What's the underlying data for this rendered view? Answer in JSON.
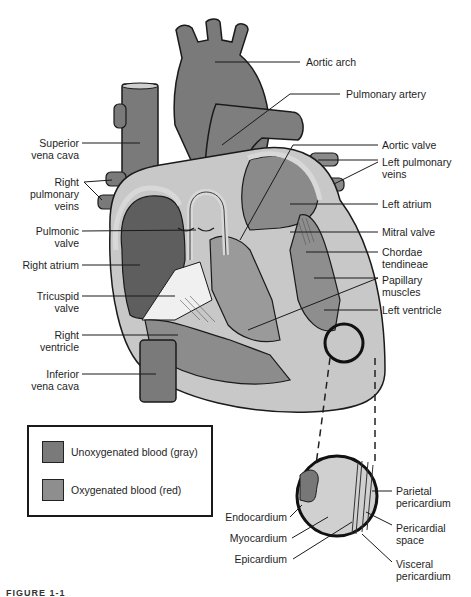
{
  "diagram": {
    "colors": {
      "unoxygenated": "#7a7a7a",
      "oxygenated": "#8c8c8c",
      "muscle_light": "#c8c8c8",
      "valve_white": "#f0f0f0",
      "outline": "#1a1a1a"
    },
    "labels_left": [
      {
        "id": "superior-vena-cava",
        "line1": "Superior",
        "line2": "vena cava"
      },
      {
        "id": "right-pulmonary-veins",
        "line1": "Right",
        "line2": "pulmonary",
        "line3": "veins"
      },
      {
        "id": "pulmonic-valve",
        "line1": "Pulmonic",
        "line2": "valve"
      },
      {
        "id": "right-atrium",
        "line1": "Right atrium"
      },
      {
        "id": "tricuspid-valve",
        "line1": "Tricuspid",
        "line2": "valve"
      },
      {
        "id": "right-ventricle",
        "line1": "Right",
        "line2": "ventricle"
      },
      {
        "id": "inferior-vena-cava",
        "line1": "Inferior",
        "line2": "vena cava"
      }
    ],
    "labels_right": [
      {
        "id": "aortic-arch",
        "line1": "Aortic arch"
      },
      {
        "id": "pulmonary-artery",
        "line1": "Pulmonary artery"
      },
      {
        "id": "aortic-valve",
        "line1": "Aortic valve"
      },
      {
        "id": "left-pulmonary-veins",
        "line1": "Left pulmonary",
        "line2": "veins"
      },
      {
        "id": "left-atrium",
        "line1": "Left atrium"
      },
      {
        "id": "mitral-valve",
        "line1": "Mitral valve"
      },
      {
        "id": "chordae-tendineae",
        "line1": "Chordae",
        "line2": "tendineae"
      },
      {
        "id": "papillary-muscles",
        "line1": "Papillary",
        "line2": "muscles"
      },
      {
        "id": "left-ventricle",
        "line1": "Left ventricle"
      }
    ],
    "inset_labels": [
      {
        "id": "endocardium",
        "line1": "Endocardium"
      },
      {
        "id": "myocardium",
        "line1": "Myocardium"
      },
      {
        "id": "epicardium",
        "line1": "Epicardium"
      },
      {
        "id": "parietal-pericardium",
        "line1": "Parietal",
        "line2": "pericardium"
      },
      {
        "id": "pericardial-space",
        "line1": "Pericardial",
        "line2": "space"
      },
      {
        "id": "visceral-pericardium",
        "line1": "Visceral",
        "line2": "pericardium"
      }
    ]
  },
  "legend": {
    "items": [
      {
        "label": "Unoxygenated blood (gray)",
        "color": "#7a7a7a"
      },
      {
        "label": "Oxygenated blood (red)",
        "color": "#8e8e8e"
      }
    ]
  },
  "caption": "FIGURE 1-1"
}
